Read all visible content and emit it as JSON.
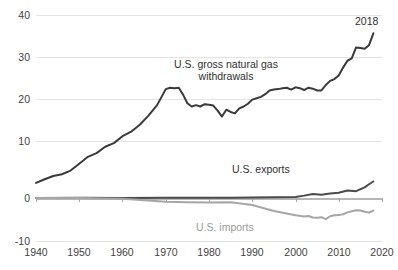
{
  "chart_data": {
    "type": "line",
    "title": "",
    "clipped_top_text": "",
    "xlabel": "",
    "ylabel": "",
    "xlim": [
      1940,
      2020
    ],
    "ylim": [
      -10,
      40
    ],
    "xticks": [
      1940,
      1950,
      1960,
      1970,
      1980,
      1990,
      2000,
      2010,
      2020
    ],
    "yticks": [
      -10,
      0,
      10,
      20,
      30,
      40
    ],
    "grid": true,
    "legend_position": "inline-annotations",
    "annotations": [
      {
        "text": "2018",
        "x": 2018,
        "y": 36,
        "color": "#2f2f2f"
      }
    ],
    "series": [
      {
        "name": "U.S. gross natural gas withdrawals",
        "color": "#3a3a3a",
        "label_line1": "U.S. gross natural gas",
        "label_line2": "withdrawals",
        "x": [
          1940,
          1942,
          1944,
          1946,
          1948,
          1950,
          1952,
          1954,
          1956,
          1958,
          1960,
          1962,
          1964,
          1966,
          1968,
          1970,
          1971,
          1972,
          1973,
          1974,
          1975,
          1976,
          1977,
          1978,
          1979,
          1980,
          1981,
          1982,
          1983,
          1984,
          1985,
          1986,
          1987,
          1988,
          1989,
          1990,
          1991,
          1992,
          1993,
          1994,
          1995,
          1996,
          1997,
          1998,
          1999,
          2000,
          2001,
          2002,
          2003,
          2004,
          2005,
          2006,
          2007,
          2008,
          2009,
          2010,
          2011,
          2012,
          2013,
          2014,
          2015,
          2016,
          2017,
          2018
        ],
        "y": [
          3.3,
          4.1,
          4.8,
          5.2,
          6.0,
          7.5,
          9.0,
          9.8,
          11.2,
          12.0,
          13.5,
          14.5,
          16.0,
          18.0,
          20.3,
          23.8,
          24.1,
          24.0,
          24.1,
          22.6,
          20.7,
          20.0,
          20.3,
          20.0,
          20.5,
          20.4,
          20.2,
          19.1,
          17.8,
          19.3,
          18.8,
          18.5,
          19.6,
          20.0,
          20.6,
          21.5,
          21.8,
          22.1,
          22.7,
          23.5,
          23.7,
          23.8,
          24.0,
          24.1,
          23.7,
          24.2,
          24.0,
          23.6,
          24.1,
          23.9,
          23.5,
          23.5,
          24.7,
          25.6,
          26.0,
          26.8,
          28.5,
          30.0,
          30.5,
          32.9,
          32.8,
          32.6,
          33.4,
          36.0
        ],
        "end_value": 36.0,
        "peak_1973": 24.1,
        "trough_1983": 17.8
      },
      {
        "name": "U.S. exports",
        "color": "#4a4a4a",
        "label": "U.S. exports",
        "x": [
          1940,
          1950,
          1960,
          1970,
          1975,
          1980,
          1985,
          1990,
          1995,
          2000,
          2002,
          2004,
          2006,
          2008,
          2010,
          2012,
          2014,
          2016,
          2017,
          2018
        ],
        "y": [
          0.02,
          0.03,
          0.01,
          0.07,
          0.07,
          0.05,
          0.06,
          0.09,
          0.15,
          0.24,
          0.52,
          0.85,
          0.72,
          0.96,
          1.14,
          1.62,
          1.49,
          2.33,
          3.0,
          3.6
        ],
        "end_value": 3.6
      },
      {
        "name": "U.S. imports",
        "color": "#a6a6a6",
        "label": "U.S. imports",
        "x": [
          1940,
          1950,
          1960,
          1970,
          1975,
          1980,
          1985,
          1990,
          1995,
          2000,
          2002,
          2003,
          2004,
          2005,
          2006,
          2007,
          2008,
          2009,
          2010,
          2011,
          2012,
          2013,
          2014,
          2015,
          2016,
          2017,
          2018
        ],
        "y": [
          -0.01,
          -0.02,
          -0.16,
          -0.82,
          -0.95,
          -1.01,
          -0.95,
          -1.53,
          -2.84,
          -3.78,
          -4.02,
          -3.94,
          -4.26,
          -4.34,
          -4.19,
          -4.61,
          -3.98,
          -3.75,
          -3.74,
          -3.55,
          -3.14,
          -2.88,
          -2.69,
          -2.72,
          -3.02,
          -3.2,
          -2.74
        ],
        "end_value": -2.74,
        "min_value": -4.61
      }
    ]
  },
  "axis": {
    "ytick_labels": [
      "40",
      "30",
      "20",
      "10",
      "0",
      "-10"
    ],
    "xtick_labels": [
      "1940",
      "1950",
      "1960",
      "1970",
      "1980",
      "1990",
      "2000",
      "2010",
      "2020"
    ]
  },
  "labels": {
    "withdrawals_line1": "U.S. gross natural gas",
    "withdrawals_line2": "withdrawals",
    "exports": "U.S. exports",
    "imports": "U.S. imports",
    "end_year": "2018"
  },
  "colors": {
    "withdrawals": "#3a3a3a",
    "exports": "#4a4a4a",
    "imports": "#a6a6a6",
    "grid": "#e4e4e4",
    "zero_line": "#b6b6b6",
    "text": "#3f3f3f"
  }
}
